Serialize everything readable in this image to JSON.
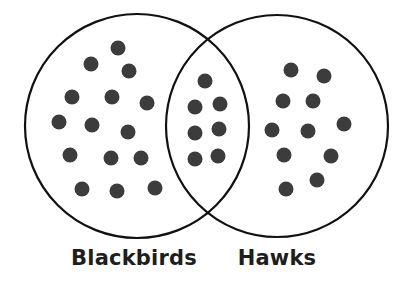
{
  "diagram": {
    "type": "venn",
    "colors": {
      "stroke": "#111111",
      "dot": "#3c3c3c",
      "background": "#ffffff",
      "label": "#1e1e1e"
    },
    "sets": [
      {
        "id": "blackbirds",
        "label": "Blackbirds",
        "circle": {
          "cx": 137,
          "cy": 126,
          "r": 112
        },
        "label_x": 134
      },
      {
        "id": "hawks",
        "label": "Hawks",
        "circle": {
          "cx": 277,
          "cy": 126,
          "r": 111
        },
        "label_x": 277
      }
    ],
    "regions": {
      "blackbirds_only": {
        "count": 15,
        "dots": [
          [
            118,
            48
          ],
          [
            91,
            64
          ],
          [
            129,
            71
          ],
          [
            72,
            97
          ],
          [
            112,
            97
          ],
          [
            147,
            103
          ],
          [
            59,
            122
          ],
          [
            92,
            125
          ],
          [
            128,
            132
          ],
          [
            70,
            155
          ],
          [
            111,
            158
          ],
          [
            141,
            158
          ],
          [
            82,
            189
          ],
          [
            117,
            191
          ],
          [
            155,
            188
          ]
        ]
      },
      "both": {
        "count": 7,
        "dots": [
          [
            205,
            81
          ],
          [
            195,
            107
          ],
          [
            220,
            104
          ],
          [
            195,
            133
          ],
          [
            219,
            129
          ],
          [
            195,
            159
          ],
          [
            218,
            156
          ]
        ]
      },
      "hawks_only": {
        "count": 11,
        "dots": [
          [
            291,
            70
          ],
          [
            324,
            76
          ],
          [
            283,
            101
          ],
          [
            313,
            101
          ],
          [
            272,
            130
          ],
          [
            308,
            131
          ],
          [
            344,
            124
          ],
          [
            284,
            155
          ],
          [
            331,
            156
          ],
          [
            286,
            189
          ],
          [
            317,
            180
          ]
        ]
      }
    },
    "dot_radius": 7.5
  }
}
